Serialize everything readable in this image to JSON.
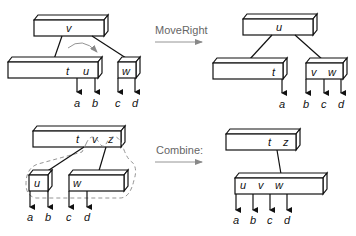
{
  "operations": [
    {
      "label": "MoveRight"
    },
    {
      "label": "Combine:"
    }
  ],
  "diagrams": {
    "moveright_before": {
      "root": {
        "keys": [
          "v"
        ]
      },
      "children": [
        {
          "keys": [
            "t",
            "u"
          ]
        },
        {
          "keys": [
            "w"
          ]
        }
      ],
      "leaves": [
        "a",
        "b",
        "c",
        "d"
      ]
    },
    "moveright_after": {
      "root": {
        "keys": [
          "u"
        ]
      },
      "children": [
        {
          "keys": [
            "t"
          ]
        },
        {
          "keys": [
            "v",
            "w"
          ]
        }
      ],
      "leaves": [
        "a",
        "b",
        "c",
        "d"
      ]
    },
    "combine_before": {
      "root": {
        "keys": [
          "t",
          "v",
          "z"
        ]
      },
      "children": [
        {
          "keys": [
            "u"
          ]
        },
        {
          "keys": [
            "w"
          ]
        }
      ],
      "leaves": [
        "a",
        "b",
        "c",
        "d"
      ]
    },
    "combine_after": {
      "root": {
        "keys": [
          "t",
          "z"
        ]
      },
      "children": [
        {
          "keys": [
            "u",
            "v",
            "w"
          ]
        }
      ],
      "leaves": [
        "a",
        "b",
        "c",
        "d"
      ]
    }
  }
}
